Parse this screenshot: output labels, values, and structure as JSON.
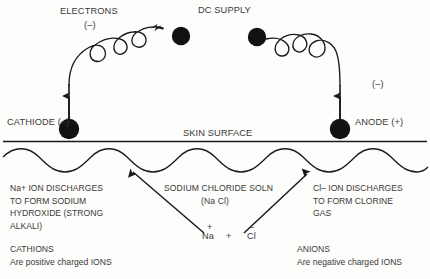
{
  "diagram": {
    "colors": {
      "ink": "#2b2b2b",
      "text": "#3a3a38",
      "background": "#fdfdfc",
      "electrode": "#111111"
    },
    "labels": {
      "electrons": "ELECTRONS",
      "electrons_charge": "(–)",
      "dc_supply": "DC SUPPLY",
      "cathode": "CATHIODE (–)",
      "anode": "ANODE (+)",
      "anode_wire_charge": "(–)",
      "skin_surface": "SKIN SURFACE",
      "solution_name": "SODIUM CHLORIDE SOLN",
      "solution_formula": "(Na Cl)"
    },
    "left_block": {
      "line1": "Na+ ION DISCHARGES",
      "line2": "TO FORM SODIUM",
      "line3": "HYDROXIDE (STRONG",
      "line4": "ALKALI)",
      "term": "CATHIONS",
      "term_desc": "Are positive charged IONS"
    },
    "right_block": {
      "line1": "Cl– ION DISCHARGES",
      "line2": "TO FORM CLORINE",
      "line3": "GAS",
      "term": "ANIONS",
      "term_desc": "Are negative charged IONS"
    },
    "ions": {
      "sodium": "Na",
      "sodium_charge": "+",
      "plus": "+",
      "chloride": "Cl",
      "chloride_charge": "–"
    }
  }
}
